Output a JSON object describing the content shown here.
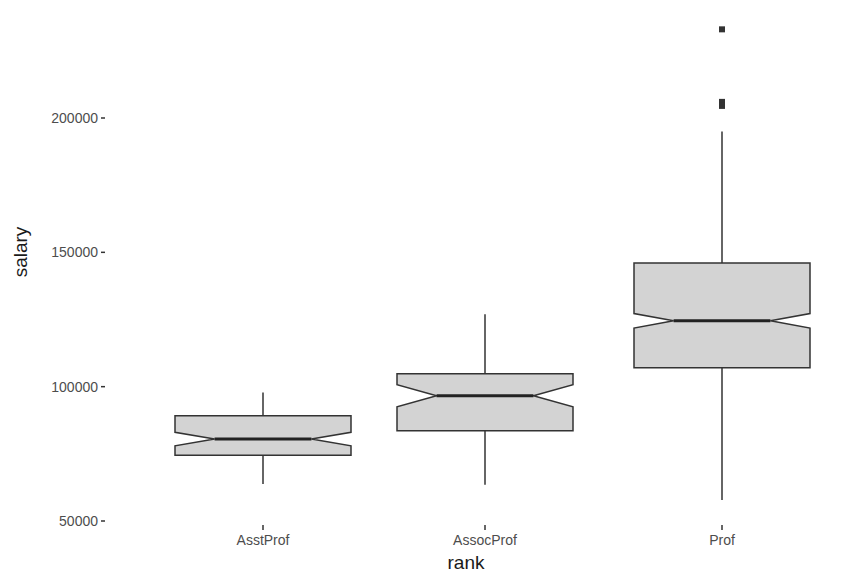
{
  "chart_data": {
    "type": "boxplot",
    "title": "",
    "xlabel": "rank",
    "ylabel": "salary",
    "ylim": [
      45000,
      236000
    ],
    "yticks": [
      50000,
      100000,
      150000,
      200000
    ],
    "ytick_labels": [
      "50000",
      "100000",
      "150000",
      "200000"
    ],
    "categories": [
      "AsstProf",
      "AssocProf",
      "Prof"
    ],
    "notched": true,
    "grid": false,
    "fill_color": "#d3d3d3",
    "line_color": "#333333",
    "boxes": [
      {
        "category": "AsstProf",
        "whisker_low": 63800,
        "q1": 74500,
        "median": 80500,
        "q3": 89200,
        "whisker_high": 97800,
        "notch_low": 78000,
        "notch_high": 83000,
        "outliers": []
      },
      {
        "category": "AssocProf",
        "whisker_low": 63500,
        "q1": 83600,
        "median": 96600,
        "q3": 104800,
        "whisker_high": 127000,
        "notch_low": 92500,
        "notch_high": 100700,
        "outliers": []
      },
      {
        "category": "Prof",
        "whisker_low": 57800,
        "q1": 107000,
        "median": 124500,
        "q3": 146000,
        "whisker_high": 195000,
        "notch_low": 121800,
        "notch_high": 127200,
        "outliers": [
          233000,
          206000,
          204500
        ]
      }
    ]
  }
}
